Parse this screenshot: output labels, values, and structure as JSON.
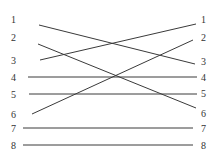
{
  "diagram": {
    "type": "crossing-lines-matching",
    "left_labels": [
      "1",
      "2",
      "3",
      "4",
      "5",
      "6",
      "7",
      "8"
    ],
    "right_labels": [
      "1",
      "2",
      "3",
      "4",
      "5",
      "6",
      "7",
      "8"
    ],
    "connections": [
      {
        "from": "1",
        "to": "3"
      },
      {
        "from": "2",
        "to": "6"
      },
      {
        "from": "3",
        "to": "1"
      },
      {
        "from": "4",
        "to": "4"
      },
      {
        "from": "5",
        "to": "5"
      },
      {
        "from": "6",
        "to": "2"
      },
      {
        "from": "7",
        "to": "7"
      },
      {
        "from": "8",
        "to": "8"
      }
    ],
    "line_color": "#3a3a3a",
    "label_color": "#333333"
  }
}
